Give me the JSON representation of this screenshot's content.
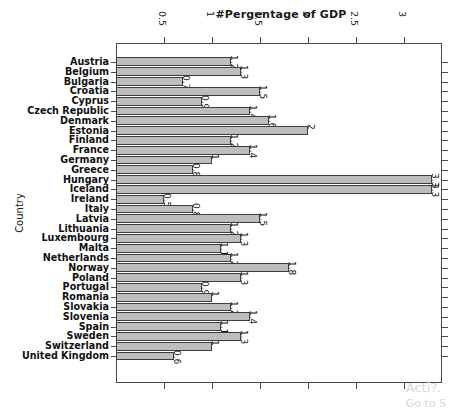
{
  "chart_data": {
    "type": "bar",
    "orientation": "horizontal",
    "title": "#Pergentage of GDP",
    "xlabel": "#Pergentage of GDP",
    "ylabel": "Country",
    "xlim": [
      0,
      3.4
    ],
    "xticks": [
      "0.5",
      "1",
      "1.5",
      "2",
      "2.5",
      "3"
    ],
    "xtick_values": [
      0.5,
      1,
      1.5,
      2,
      2.5,
      3
    ],
    "grid": false,
    "legend": null,
    "axis_position": "top",
    "categories": [
      "Austria",
      "Belgium",
      "Bulgaria",
      "Croatia",
      "Cyprus",
      "Czech Republic",
      "Denmark",
      "Estonia",
      "Finland",
      "France",
      "Germany",
      "Greece",
      "Hungary",
      "Iceland",
      "Ireland",
      "Italy",
      "Latvia",
      "Lithuania",
      "Luxembourg",
      "Malta",
      "Netherlands",
      "Norway",
      "Poland",
      "Portugal",
      "Romania",
      "Slovakia",
      "Slovenia",
      "Spain",
      "Sweden",
      "Switzerland",
      "United Kingdom"
    ],
    "values": [
      1.2,
      1.3,
      0.7,
      1.5,
      0.9,
      1.4,
      1.6,
      2,
      1.2,
      1.4,
      1,
      0.8,
      3.3,
      3.3,
      0.5,
      0.8,
      1.5,
      1.2,
      1.3,
      1.1,
      1.2,
      1.8,
      1.3,
      0.9,
      1,
      1.2,
      1.4,
      1.1,
      1.3,
      1,
      0.6
    ],
    "value_labels": [
      "1.2",
      "1.3",
      "0.7",
      "1.5",
      "0.9",
      "1.4",
      "1.6",
      "2",
      "1.2",
      "1.4",
      "1",
      "0.8",
      "3.3",
      "3.3",
      "0.5",
      "0.8",
      "1.5",
      "1.2",
      "1.3",
      "1.1",
      "1.2",
      "1.8",
      "1.3",
      "0.9",
      "1",
      "1.2",
      "1.4",
      "1.1",
      "1.3",
      "1",
      "0.6"
    ],
    "bar_color": "#bdbdbd",
    "bar_edge_color": "#3d3d3d"
  },
  "watermark": {
    "line1": "Acti?.",
    "line2": "Go to S"
  }
}
